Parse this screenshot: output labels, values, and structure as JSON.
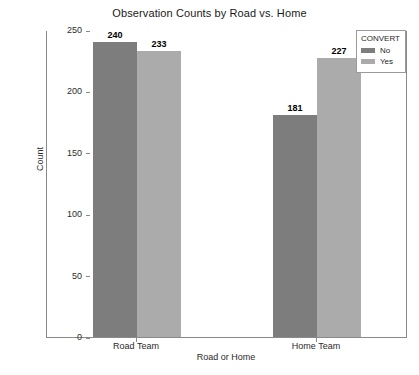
{
  "chart_data": {
    "type": "bar",
    "title": "Observation Counts by Road vs. Home",
    "xlabel": "Road or Home",
    "ylabel": "Count",
    "categories": [
      "Road Team",
      "Home Team"
    ],
    "series": [
      {
        "name": "No",
        "values": [
          240,
          181
        ],
        "color": "#7d7d7d"
      },
      {
        "name": "Yes",
        "values": [
          233,
          227
        ],
        "color": "#ababab"
      }
    ],
    "legend_title": "CONVERT",
    "legend_position": "top-right",
    "ylim": [
      0,
      250
    ],
    "yticks": [
      0,
      50,
      100,
      150,
      200,
      250
    ],
    "ytick_labels": [
      "0",
      "50",
      "100",
      "150",
      "200",
      "250"
    ],
    "grid": false,
    "data_labels": [
      "240",
      "233",
      "181",
      "227"
    ],
    "axis_color": "#8a8a8a",
    "background": "#ffffff"
  }
}
